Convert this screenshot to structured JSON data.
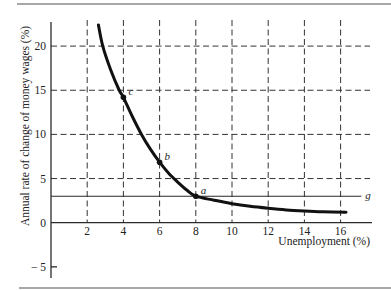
{
  "chart_data": {
    "type": "line",
    "title": "",
    "xlabel": "Unemployment (%)",
    "ylabel": "Annual rate of change of money wages (%)",
    "xlim": [
      0,
      17.5
    ],
    "ylim": [
      -6,
      23
    ],
    "grid": "dashed",
    "legend": "none",
    "xticks": [
      {
        "value": 2,
        "label": "2"
      },
      {
        "value": 4,
        "label": "4"
      },
      {
        "value": 6,
        "label": "6"
      },
      {
        "value": 8,
        "label": "8"
      },
      {
        "value": 10,
        "label": "10"
      },
      {
        "value": 12,
        "label": "12"
      },
      {
        "value": 14,
        "label": "14"
      },
      {
        "value": 16,
        "label": "16"
      }
    ],
    "yticks": [
      {
        "value": -5,
        "label": "− 5"
      },
      {
        "value": 0,
        "label": "0"
      },
      {
        "value": 5,
        "label": "5"
      },
      {
        "value": 10,
        "label": "10"
      },
      {
        "value": 15,
        "label": "15"
      },
      {
        "value": 20,
        "label": "20"
      }
    ],
    "series": [
      {
        "name": "Phillips curve",
        "x": [
          2.62,
          2.86,
          3.3,
          3.77,
          4.0,
          4.5,
          5.0,
          5.5,
          6.0,
          6.5,
          7.0,
          7.5,
          8.0,
          9.0,
          10.0,
          11.0,
          12.0,
          13.0,
          14.0,
          15.0,
          16.3
        ],
        "y": [
          22.4,
          20.0,
          17.3,
          15.0,
          14.2,
          12.0,
          10.0,
          8.3,
          6.85,
          5.6,
          4.6,
          3.7,
          3.0,
          2.55,
          2.15,
          1.85,
          1.63,
          1.45,
          1.33,
          1.24,
          1.18
        ]
      }
    ],
    "points": [
      {
        "label": "c",
        "x": 4,
        "y": 14.2
      },
      {
        "label": "b",
        "x": 6,
        "y": 6.85
      },
      {
        "label": "a",
        "x": 8,
        "y": 3.0
      }
    ],
    "hlines": [
      {
        "label": "g",
        "y": 3.0,
        "x_end": 17.2
      }
    ]
  }
}
